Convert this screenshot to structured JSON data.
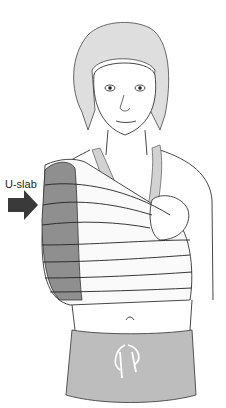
{
  "figure": {
    "label": "U-slab",
    "colors": {
      "splint": "#8f8f8f",
      "arrow": "#3a3a3a",
      "hair": "#d8d8d8",
      "sling": "#cfcfcf",
      "pants": "#b5b5b5",
      "line": "#222222"
    }
  }
}
